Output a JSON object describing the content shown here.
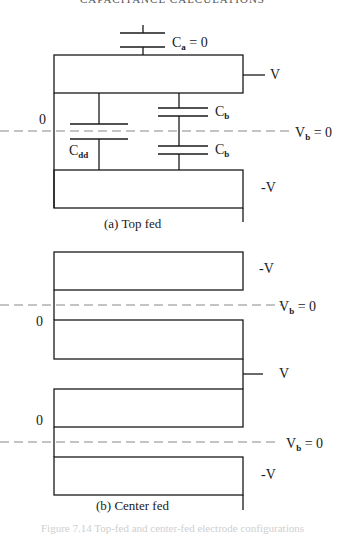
{
  "page": {
    "running_header": "CAPACITANCE CALCULATIONS",
    "page_number": "",
    "figure_caption": "Figure 7.14 Top-fed and center-fed electrode configurations"
  },
  "figure_a": {
    "caption": "(a) Top fed",
    "labels": {
      "ca": "C",
      "ca_sub": "a",
      "ca_value": " = 0",
      "v_top": "V",
      "zero_left": "0",
      "cb_upper": "C",
      "cb_upper_sub": "b",
      "cb_lower": "C",
      "cb_lower_sub": "b",
      "cdd": "C",
      "cdd_sub": "dd",
      "vb": "V",
      "vb_sub": "b",
      "vb_value": " = 0",
      "v_bottom": "-V"
    }
  },
  "figure_b": {
    "caption": "(b) Center fed",
    "labels": {
      "v_top": "-V",
      "vb_upper": "V",
      "vb_upper_sub": "b",
      "vb_upper_value": " = 0",
      "zero_upper": "0",
      "v_center": "V",
      "zero_lower": "0",
      "vb_lower": "V",
      "vb_lower_sub": "b",
      "vb_lower_value": " = 0",
      "v_bottom": "-V"
    }
  },
  "colors": {
    "line": "#1a1a1a",
    "dashed": "#888888",
    "background": "#ffffff"
  }
}
